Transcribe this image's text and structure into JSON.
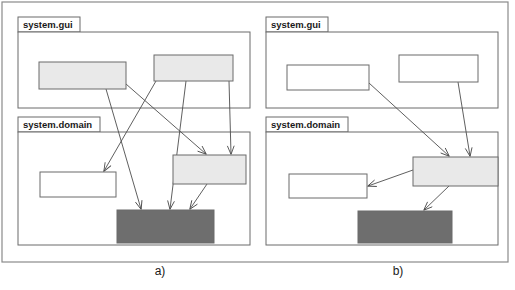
{
  "figure": {
    "width": 515,
    "height": 290,
    "background": "#ffffff",
    "outer_frame": {
      "x": 2,
      "y": 2,
      "width": 506,
      "height": 260,
      "stroke": "#8a8a8a"
    }
  },
  "colors": {
    "line": "#4d4d4d",
    "box_stroke": "#6b6b6b",
    "fill_white": "#ffffff",
    "fill_light": "#e9e9e9",
    "fill_dark": "#6e6e6e",
    "text": "#1a1a1a",
    "frame": "#8a8a8a"
  },
  "panels": [
    {
      "id": "panel-a",
      "caption": "a)",
      "caption_pos": {
        "x": 160,
        "y": 275
      },
      "packages": [
        {
          "name": "system.gui",
          "tab": {
            "x": 18,
            "y": 17,
            "width": 62,
            "height": 15
          },
          "body": {
            "x": 18,
            "y": 32,
            "width": 232,
            "height": 76
          },
          "label_pos": {
            "x": 23,
            "y": 28
          }
        },
        {
          "name": "system.domain",
          "tab": {
            "x": 18,
            "y": 117,
            "width": 82,
            "height": 15
          },
          "body": {
            "x": 18,
            "y": 132,
            "width": 232,
            "height": 113
          },
          "label_pos": {
            "x": 23,
            "y": 128
          }
        }
      ],
      "classes": [
        {
          "id": "a-gui-left",
          "fill": "light",
          "x": 39,
          "y": 62,
          "width": 87,
          "height": 27
        },
        {
          "id": "a-gui-right",
          "fill": "light",
          "x": 154,
          "y": 55,
          "width": 79,
          "height": 26
        },
        {
          "id": "a-dom-white",
          "fill": "white",
          "x": 40,
          "y": 172,
          "width": 76,
          "height": 25
        },
        {
          "id": "a-dom-light",
          "fill": "light",
          "x": 173,
          "y": 155,
          "width": 73,
          "height": 29
        },
        {
          "id": "a-dom-dark",
          "fill": "dark",
          "x": 117,
          "y": 210,
          "width": 97,
          "height": 33
        }
      ],
      "arrows": [
        {
          "from": "a-gui-left",
          "to": "a-dom-dark",
          "x1": 106,
          "y1": 89,
          "x2": 141,
          "y2": 209
        },
        {
          "from": "a-gui-left",
          "to": "a-dom-light",
          "x1": 126,
          "y1": 84,
          "x2": 206,
          "y2": 154
        },
        {
          "from": "a-gui-right",
          "to": "a-dom-white",
          "x1": 156,
          "y1": 81,
          "x2": 104,
          "y2": 171
        },
        {
          "from": "a-gui-right",
          "to": "a-dom-dark",
          "x1": 186,
          "y1": 81,
          "x2": 170,
          "y2": 209
        },
        {
          "from": "a-gui-right",
          "to": "a-dom-light",
          "x1": 229,
          "y1": 81,
          "x2": 231,
          "y2": 154
        },
        {
          "from": "a-dom-light",
          "to": "a-dom-dark",
          "x1": 207,
          "y1": 184,
          "x2": 190,
          "y2": 209
        }
      ]
    },
    {
      "id": "panel-b",
      "caption": "b)",
      "caption_pos": {
        "x": 398,
        "y": 275
      },
      "packages": [
        {
          "name": "system.gui",
          "tab": {
            "x": 266,
            "y": 17,
            "width": 62,
            "height": 15
          },
          "body": {
            "x": 266,
            "y": 32,
            "width": 232,
            "height": 76
          },
          "label_pos": {
            "x": 271,
            "y": 28
          }
        },
        {
          "name": "system.domain",
          "tab": {
            "x": 266,
            "y": 117,
            "width": 82,
            "height": 15
          },
          "body": {
            "x": 266,
            "y": 132,
            "width": 232,
            "height": 113
          },
          "label_pos": {
            "x": 271,
            "y": 128
          }
        }
      ],
      "classes": [
        {
          "id": "b-gui-left",
          "fill": "white",
          "x": 287,
          "y": 65,
          "width": 82,
          "height": 25
        },
        {
          "id": "b-gui-right",
          "fill": "white",
          "x": 399,
          "y": 55,
          "width": 79,
          "height": 27
        },
        {
          "id": "b-dom-white",
          "fill": "white",
          "x": 289,
          "y": 174,
          "width": 78,
          "height": 24
        },
        {
          "id": "b-dom-light",
          "fill": "light",
          "x": 413,
          "y": 157,
          "width": 85,
          "height": 29
        },
        {
          "id": "b-dom-dark",
          "fill": "dark",
          "x": 358,
          "y": 211,
          "width": 94,
          "height": 32
        }
      ],
      "arrows": [
        {
          "from": "b-gui-left",
          "to": "b-dom-light",
          "x1": 369,
          "y1": 83,
          "x2": 449,
          "y2": 156
        },
        {
          "from": "b-gui-right",
          "to": "b-dom-light",
          "x1": 458,
          "y1": 82,
          "x2": 470,
          "y2": 156
        },
        {
          "from": "b-dom-light",
          "to": "b-dom-white",
          "x1": 413,
          "y1": 170,
          "x2": 368,
          "y2": 186
        },
        {
          "from": "b-dom-light",
          "to": "b-dom-dark",
          "x1": 449,
          "y1": 186,
          "x2": 424,
          "y2": 210
        }
      ]
    }
  ]
}
